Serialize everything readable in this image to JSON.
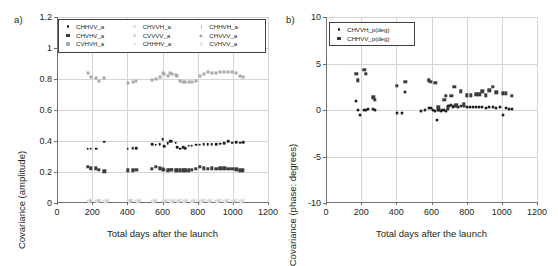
{
  "figure": {
    "panel_a_letter": "a)",
    "panel_b_letter": "b)"
  },
  "chart_data": [
    {
      "type": "scatter",
      "panel": "a)",
      "title": "",
      "xlabel": "Total days after the launch",
      "ylabel": "Covariance (amplitude)",
      "xlim": [
        0,
        1200
      ],
      "ylim": [
        0,
        1.2
      ],
      "xticks": [
        0,
        200,
        400,
        600,
        800,
        1000,
        1200
      ],
      "xticklabels": [
        "0",
        "200",
        "400",
        "600",
        "800",
        "1000",
        "1200"
      ],
      "yticks": [
        0,
        0.2,
        0.4,
        0.6,
        0.8,
        1,
        1.2
      ],
      "yticklabels": [
        "0",
        "0.2",
        "0.4",
        "0.6",
        "0.8",
        "1",
        "1.2"
      ],
      "grid": true,
      "legend_position": "upper-center",
      "series": [
        {
          "name": "CHHVV_a",
          "marker": "circle",
          "color": "#231f20",
          "filled": true,
          "size": 2.6,
          "x": [
            175,
            192,
            222,
            268,
            402,
            430,
            452,
            540,
            562,
            585,
            600,
            608,
            630,
            645,
            652,
            675,
            682,
            700,
            718,
            730,
            748,
            765,
            790,
            812,
            835,
            858,
            880,
            905,
            928,
            952,
            975,
            998,
            1020,
            1042,
            1058
          ],
          "y": [
            0.35,
            0.35,
            0.35,
            0.395,
            0.35,
            0.355,
            0.355,
            0.38,
            0.375,
            0.38,
            0.41,
            0.365,
            0.385,
            0.4,
            0.4,
            0.39,
            0.36,
            0.35,
            0.36,
            0.355,
            0.37,
            0.37,
            0.375,
            0.375,
            0.378,
            0.378,
            0.38,
            0.38,
            0.382,
            0.385,
            0.4,
            0.39,
            0.392,
            0.39,
            0.392
          ]
        },
        {
          "name": "CHVHV_a",
          "marker": "square",
          "color": "#3b3b3d",
          "filled": true,
          "size": 3.4,
          "x": [
            175,
            192,
            222,
            238,
            268,
            402,
            430,
            452,
            540,
            562,
            585,
            600,
            608,
            630,
            645,
            652,
            675,
            682,
            700,
            718,
            730,
            748,
            765,
            790,
            812,
            835,
            858,
            880,
            905,
            928,
            952,
            975,
            998,
            1020,
            1042,
            1058
          ],
          "y": [
            0.235,
            0.225,
            0.225,
            0.215,
            0.205,
            0.21,
            0.21,
            0.213,
            0.222,
            0.235,
            0.225,
            0.218,
            0.215,
            0.212,
            0.215,
            0.215,
            0.212,
            0.212,
            0.212,
            0.21,
            0.212,
            0.212,
            0.215,
            0.222,
            0.235,
            0.225,
            0.222,
            0.225,
            0.222,
            0.225,
            0.225,
            0.222,
            0.222,
            0.218,
            0.212,
            0.21
          ]
        },
        {
          "name": "CVHVH_a",
          "marker": "square",
          "color": "#a7a9ac",
          "filled": true,
          "size": 3.0,
          "x": [
            175,
            192,
            222,
            238,
            268,
            402,
            430,
            452,
            540,
            562,
            585,
            600,
            608,
            630,
            645,
            652,
            675,
            682,
            700,
            718,
            730,
            748,
            765,
            790,
            812,
            835,
            858,
            880,
            905,
            928,
            952,
            975,
            998,
            1020,
            1042,
            1058
          ],
          "y": [
            0.838,
            0.81,
            0.805,
            0.79,
            0.805,
            0.772,
            0.778,
            0.785,
            0.795,
            0.8,
            0.812,
            0.84,
            0.83,
            0.822,
            0.838,
            0.83,
            0.825,
            0.818,
            0.79,
            0.778,
            0.78,
            0.778,
            0.778,
            0.79,
            0.822,
            0.835,
            0.845,
            0.84,
            0.838,
            0.848,
            0.845,
            0.845,
            0.845,
            0.84,
            0.818,
            0.812
          ]
        },
        {
          "name": "CHVVH_a",
          "marker": "circle",
          "color": "#c9cacc",
          "filled": false,
          "size": 2.8,
          "x": [
            175,
            222,
            268,
            402,
            452,
            540,
            600,
            645,
            682,
            718,
            765,
            812,
            858,
            905,
            952,
            998,
            1042
          ],
          "y": [
            0.012,
            0.012,
            0.012,
            0.012,
            0.012,
            0.012,
            0.012,
            0.012,
            0.012,
            0.012,
            0.012,
            0.012,
            0.012,
            0.012,
            0.012,
            0.012,
            0.012
          ]
        },
        {
          "name": "CVVVV_a",
          "marker": "square",
          "color": "#d9dadb",
          "filled": true,
          "size": 3.0,
          "x": [
            185,
            232,
            278,
            412,
            462,
            552,
            612,
            655,
            692,
            728,
            775,
            822,
            868,
            915,
            962,
            1008,
            1052
          ],
          "y": [
            0.014,
            0.014,
            0.014,
            0.014,
            0.014,
            0.014,
            0.014,
            0.014,
            0.014,
            0.014,
            0.014,
            0.014,
            0.014,
            0.014,
            0.014,
            0.014,
            0.014
          ]
        },
        {
          "name": "CHHHV_a",
          "marker": "circle",
          "color": "#e2e3e4",
          "filled": true,
          "size": 2.8,
          "x": [
            180,
            228,
            272,
            408,
            458,
            546,
            606,
            650,
            688,
            724,
            770,
            818,
            862,
            910,
            958,
            1004,
            1048
          ],
          "y": [
            0.008,
            0.008,
            0.008,
            0.008,
            0.008,
            0.008,
            0.008,
            0.008,
            0.008,
            0.008,
            0.008,
            0.008,
            0.008,
            0.008,
            0.008,
            0.008,
            0.008
          ]
        },
        {
          "name": "CHHVH_a",
          "marker": "bar",
          "color": "#bcbec0",
          "filled": true,
          "size": 3.0,
          "x": [
            188,
            236,
            282,
            418,
            468,
            556,
            618,
            660,
            696,
            734,
            780,
            828,
            872,
            920,
            966,
            1012,
            1056
          ],
          "y": [
            0.016,
            0.016,
            0.016,
            0.016,
            0.016,
            0.016,
            0.016,
            0.016,
            0.016,
            0.016,
            0.016,
            0.016,
            0.016,
            0.016,
            0.016,
            0.016,
            0.016
          ]
        },
        {
          "name": "CHVVV_a",
          "marker": "triangle",
          "color": "#9a9c9f",
          "filled": true,
          "size": 3.2,
          "x": [
            196,
            244,
            288,
            424,
            474,
            562,
            624,
            666,
            702,
            740,
            786,
            834,
            878,
            926,
            972,
            1018,
            1060
          ],
          "y": [
            0.018,
            0.018,
            0.018,
            0.018,
            0.018,
            0.018,
            0.018,
            0.018,
            0.018,
            0.018,
            0.018,
            0.018,
            0.018,
            0.018,
            0.018,
            0.018,
            0.018
          ]
        },
        {
          "name": "CVHVV_a",
          "marker": "square",
          "color": "#eceded",
          "filled": true,
          "size": 3.0,
          "x": [
            202,
            250,
            294,
            430,
            480,
            568,
            630,
            672,
            708,
            746,
            792,
            840,
            884,
            932,
            978,
            1024,
            1064
          ],
          "y": [
            0.02,
            0.02,
            0.02,
            0.02,
            0.02,
            0.02,
            0.02,
            0.02,
            0.02,
            0.02,
            0.02,
            0.02,
            0.02,
            0.02,
            0.02,
            0.02,
            0.02
          ]
        }
      ],
      "legend": [
        [
          {
            "label": "CHHVV_a",
            "marker": "circle",
            "color": "#231f20",
            "filled": true
          },
          {
            "label": "CHVHV_a",
            "marker": "square",
            "color": "#3b3b3d",
            "filled": true
          },
          {
            "label": "CVHVH_a",
            "marker": "square",
            "color": "#a7a9ac",
            "filled": true
          }
        ],
        [
          {
            "label": "CHVVH_a",
            "marker": "circle",
            "color": "#c9cacc",
            "filled": false
          },
          {
            "label": "CVVVV_a",
            "marker": "square",
            "color": "#d9dadb",
            "filled": true
          },
          {
            "label": "CHHHV_a",
            "marker": "circle",
            "color": "#e2e3e4",
            "filled": true
          }
        ],
        [
          {
            "label": "CHHVH_a",
            "marker": "bar",
            "color": "#bcbec0",
            "filled": true
          },
          {
            "label": "CHVVV_a",
            "marker": "triangle",
            "color": "#9a9c9f",
            "filled": true
          },
          {
            "label": "CVHVV_a",
            "marker": "square",
            "color": "#eceded",
            "filled": true
          }
        ]
      ]
    },
    {
      "type": "scatter",
      "panel": "b)",
      "title": "",
      "xlabel": "Total days after the launch",
      "ylabel": "Covariance (phase: degrees)",
      "xlim": [
        0,
        1200
      ],
      "ylim": [
        -10,
        10
      ],
      "xticks": [
        0,
        200,
        400,
        600,
        800,
        1000,
        1200
      ],
      "xticklabels": [
        "0",
        "200",
        "400",
        "600",
        "800",
        "1000",
        "1200"
      ],
      "yticks": [
        -10,
        -5,
        0,
        5,
        10
      ],
      "yticklabels": [
        "-10",
        "-5",
        "0",
        "5",
        "10"
      ],
      "grid": true,
      "legend_position": "upper-left",
      "series": [
        {
          "name": "CHVVH_p(deg)",
          "marker": "circle",
          "color": "#231f20",
          "filled": true,
          "size": 3.0,
          "x": [
            172,
            180,
            196,
            218,
            228,
            238,
            268,
            278,
            402,
            430,
            452,
            540,
            562,
            585,
            596,
            608,
            622,
            630,
            638,
            645,
            652,
            662,
            672,
            682,
            692,
            700,
            712,
            722,
            730,
            742,
            752,
            765,
            782,
            800,
            818,
            835,
            855,
            872,
            890,
            908,
            928,
            948,
            968,
            988,
            1005,
            1022,
            1042,
            1058
          ],
          "y": [
            1.0,
            0.0,
            -0.5,
            0.0,
            0.05,
            0.1,
            0.1,
            0.05,
            -0.35,
            -0.3,
            1.9,
            -0.1,
            0.0,
            0.2,
            0.25,
            0.0,
            -0.1,
            -1.1,
            0.0,
            0.05,
            -0.1,
            0.0,
            0.05,
            -0.1,
            0.4,
            0.45,
            0.5,
            0.3,
            0.45,
            0.4,
            0.35,
            0.45,
            0.4,
            0.35,
            0.3,
            0.35,
            0.3,
            0.3,
            0.3,
            0.25,
            0.3,
            0.3,
            0.25,
            0.3,
            -0.5,
            0.2,
            0.15,
            0.15
          ]
        },
        {
          "name": "CHHVV_p(deg)",
          "marker": "square",
          "color": "#3b3b3d",
          "filled": true,
          "size": 3.4,
          "x": [
            172,
            180,
            218,
            228,
            268,
            276,
            402,
            452,
            585,
            596,
            622,
            638,
            672,
            682,
            692,
            712,
            730,
            742,
            765,
            782,
            800,
            822,
            855,
            872,
            890,
            908,
            928,
            948,
            968,
            1005,
            1022,
            1058
          ],
          "y": [
            3.9,
            3.2,
            4.3,
            3.9,
            1.35,
            1.1,
            2.6,
            3.0,
            3.2,
            3.0,
            2.9,
            0.3,
            1.1,
            1.5,
            0.2,
            1.5,
            2.5,
            0.5,
            2.0,
            0.6,
            1.6,
            1.6,
            1.7,
            1.7,
            2.0,
            1.6,
            2.1,
            2.5,
            1.9,
            1.8,
            1.8,
            1.5
          ]
        }
      ],
      "legend": [
        [
          {
            "label": "CHVVH_p(deg)",
            "marker": "circle",
            "color": "#231f20",
            "filled": true
          },
          {
            "label": "CHHVV_p(deg)",
            "marker": "square",
            "color": "#3b3b3d",
            "filled": true
          }
        ]
      ]
    }
  ]
}
